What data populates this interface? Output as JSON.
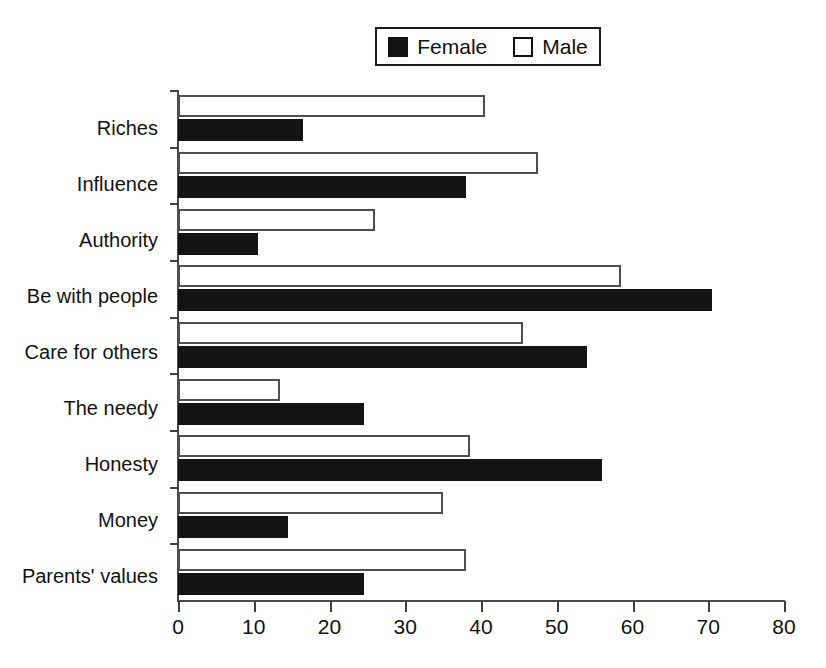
{
  "chart_data": {
    "type": "bar",
    "orientation": "horizontal",
    "title": "",
    "xlabel": "",
    "ylabel": "",
    "xlim": [
      0,
      80
    ],
    "xticks": [
      0,
      10,
      20,
      30,
      40,
      50,
      60,
      70,
      80
    ],
    "grid": false,
    "legend_position": "top-center",
    "categories": [
      "Riches",
      "Influence",
      "Authority",
      "Be with people",
      "Care for others",
      "The needy",
      "Honesty",
      "Money",
      "Parents' values"
    ],
    "series": [
      {
        "name": "Female",
        "color": "#131313",
        "style": "filled",
        "values": [
          16.5,
          38.0,
          10.5,
          70.5,
          54.0,
          24.5,
          56.0,
          14.5,
          24.5
        ]
      },
      {
        "name": "Male",
        "color": "#ffffff",
        "style": "outlined",
        "values": [
          40.5,
          47.5,
          26.0,
          58.5,
          45.5,
          13.5,
          38.5,
          35.0,
          38.0
        ]
      }
    ]
  },
  "legend": {
    "entries": [
      {
        "label": "Female",
        "swatch": "filled-square-icon"
      },
      {
        "label": "Male",
        "swatch": "hollow-square-icon"
      }
    ]
  },
  "axis": {
    "x_tick_labels": [
      "0",
      "10",
      "20",
      "30",
      "40",
      "50",
      "60",
      "70",
      "80"
    ]
  }
}
